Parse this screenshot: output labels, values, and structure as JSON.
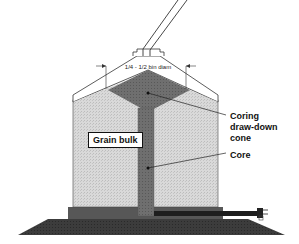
{
  "diagram": {
    "labels": {
      "diameter": "1/4 - 1/2 bin diam",
      "coring_cone_line1": "Coring",
      "coring_cone_line2": "draw-down",
      "coring_cone_line3": "cone",
      "core": "Core",
      "grain_bulk": "Grain bulk"
    },
    "colors": {
      "grain_fill": "#d8d8d8",
      "cone_fill": "#6e6e6e",
      "core_fill": "#7a7a7a",
      "base_slab": "#555555",
      "floor": "#3a3a3a",
      "outline": "#222222"
    }
  }
}
